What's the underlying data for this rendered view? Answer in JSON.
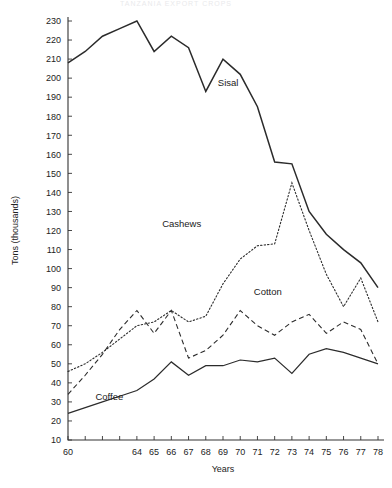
{
  "page": {
    "faint_header": "TANZANIA  EXPORT  CROPS"
  },
  "chart_data": {
    "type": "line",
    "title": "",
    "xlabel": "Years",
    "ylabel": "Tons (thousands)",
    "x": [
      60,
      61,
      62,
      63,
      64,
      65,
      66,
      67,
      68,
      69,
      70,
      71,
      72,
      73,
      74,
      75,
      76,
      77,
      78
    ],
    "xtick_labels": [
      "60",
      "",
      "",
      "",
      "64",
      "65",
      "66",
      "67",
      "68",
      "69",
      "70",
      "71",
      "72",
      "73",
      "74",
      "75",
      "76",
      "77",
      "78"
    ],
    "ytick_labels": [
      "10",
      "20",
      "30",
      "40",
      "50",
      "60",
      "70",
      "80",
      "90",
      "100",
      "110",
      "120",
      "130",
      "140",
      "150",
      "160",
      "170",
      "180",
      "190",
      "200",
      "210",
      "220",
      "230"
    ],
    "ylim": [
      10,
      230
    ],
    "xlim": [
      60,
      78
    ],
    "ytick_step": 10,
    "grid": false,
    "legend_position": "inline-annotations",
    "series": [
      {
        "name": "Sisal",
        "style": "solid",
        "label_x": 69.3,
        "label_y": 196,
        "values": [
          208,
          214,
          222,
          226,
          230,
          214,
          222,
          216,
          193,
          210,
          202,
          185,
          156,
          155,
          130,
          118,
          110,
          103,
          90
        ]
      },
      {
        "name": "Cashews",
        "style": "dotted",
        "label_x": 66.6,
        "label_y": 122,
        "values": [
          46,
          50,
          56,
          63,
          70,
          72,
          78,
          72,
          75,
          92,
          105,
          112,
          113,
          145,
          120,
          97,
          80,
          95,
          72
        ]
      },
      {
        "name": "Cotton",
        "style": "dashed",
        "label_x": 71.6,
        "label_y": 86,
        "values": [
          34,
          44,
          55,
          68,
          78,
          66,
          78,
          53,
          57,
          65,
          78,
          70,
          65,
          72,
          76,
          66,
          72,
          68,
          50
        ]
      },
      {
        "name": "Coffee",
        "style": "solid-thin",
        "label_x": 62.4,
        "label_y": 31,
        "values": [
          24,
          27,
          30,
          33,
          36,
          42,
          51,
          44,
          49,
          49,
          52,
          51,
          53,
          45,
          55,
          58,
          56,
          53,
          50
        ]
      }
    ]
  }
}
